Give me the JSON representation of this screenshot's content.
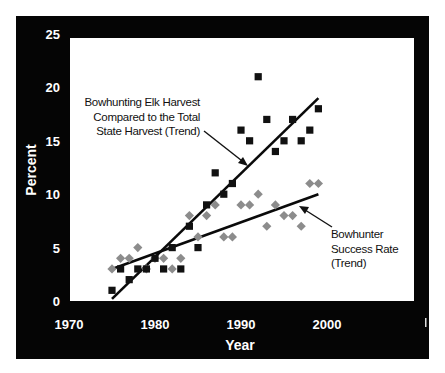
{
  "chart_data": {
    "type": "scatter",
    "title": "",
    "xlabel": "Year",
    "ylabel": "Percent",
    "xlim": [
      1970,
      2010
    ],
    "ylim": [
      0,
      25
    ],
    "x_ticks": [
      "1970",
      "1980",
      "1990",
      "2000"
    ],
    "y_ticks": [
      "0",
      "5",
      "10",
      "15",
      "20",
      "25"
    ],
    "grid": false,
    "legend": "none (inline annotations with arrows)",
    "x": [
      1975,
      1976,
      1977,
      1978,
      1979,
      1980,
      1981,
      1982,
      1983,
      1984,
      1985,
      1986,
      1987,
      1988,
      1989,
      1990,
      1991,
      1992,
      1993,
      1994,
      1995,
      1996,
      1997,
      1998,
      1999
    ],
    "series": [
      {
        "name": "Bowhunting Elk Harvest Compared to the Total State Harvest",
        "marker": "square",
        "color": "#111111",
        "values": [
          1,
          3,
          2,
          3,
          3,
          4,
          3,
          5,
          3,
          7,
          5,
          9,
          12,
          10,
          11,
          16,
          15,
          21,
          17,
          14,
          15,
          17,
          15,
          16,
          18
        ],
        "trend": {
          "x": [
            1975,
            1999
          ],
          "y": [
            0.2,
            19
          ]
        }
      },
      {
        "name": "Bowhunter Success Rate",
        "marker": "diamond",
        "color": "#8c8c8c",
        "values": [
          3,
          4,
          4,
          5,
          3,
          4,
          4,
          3,
          4,
          8,
          6,
          8,
          9,
          6,
          6,
          9,
          9,
          10,
          7,
          9,
          8,
          8,
          7,
          11,
          11
        ],
        "trend": {
          "x": [
            1975,
            1999
          ],
          "y": [
            3,
            10
          ]
        }
      }
    ],
    "annotations": [
      {
        "lines": [
          "Bowhunting Elk Harvest",
          "Compared to the Total",
          "State Harvest (Trend)"
        ]
      },
      {
        "lines": [
          "Bowhunter",
          "Success Rate",
          "(Trend)"
        ]
      }
    ]
  },
  "labels": {
    "xlabel": "Year",
    "ylabel": "Percent",
    "annot_elk": [
      "Bowhunting Elk Harvest",
      "Compared to the Total",
      "State Harvest (Trend)"
    ],
    "annot_success": [
      "Bowhunter",
      "Success Rate",
      "(Trend)"
    ]
  }
}
